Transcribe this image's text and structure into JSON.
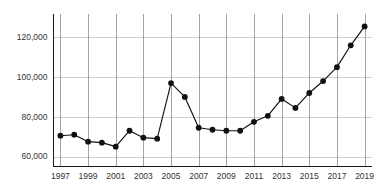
{
  "chart_data": {
    "type": "line",
    "title": "",
    "subtitle": "",
    "xlabel": "",
    "ylabel": "",
    "x": [
      1997,
      1998,
      1999,
      2000,
      2001,
      2002,
      2003,
      2004,
      2005,
      2006,
      2007,
      2008,
      2009,
      2010,
      2011,
      2012,
      2013,
      2014,
      2015,
      2016,
      2017,
      2018,
      2019
    ],
    "values": [
      70500,
      71000,
      67500,
      67000,
      65000,
      73000,
      69500,
      69000,
      97000,
      90000,
      74500,
      73500,
      73000,
      73000,
      77500,
      80500,
      89000,
      84500,
      92000,
      98000,
      105000,
      116000,
      125500
    ],
    "series": [
      {
        "name": "",
        "values": [
          70500,
          71000,
          67500,
          67000,
          65000,
          73000,
          69500,
          69000,
          97000,
          90000,
          74500,
          73500,
          73000,
          73000,
          77500,
          80500,
          89000,
          84500,
          92000,
          98000,
          105000,
          116000,
          125500
        ]
      }
    ],
    "xlim": [
      1996.5,
      2019.5
    ],
    "ylim": [
      55000,
      132000
    ],
    "x_tick_labels": [
      "1997",
      "1999",
      "2001",
      "2003",
      "2005",
      "2007",
      "2009",
      "2011",
      "2013",
      "2015",
      "2017",
      "2019"
    ],
    "x_tick_values": [
      1997,
      1999,
      2001,
      2003,
      2005,
      2007,
      2009,
      2011,
      2013,
      2015,
      2017,
      2019
    ],
    "y_tick_labels": [
      "60,000",
      "80,000",
      "100,000",
      "120,000"
    ],
    "y_tick_values": [
      60000,
      80000,
      100000,
      120000
    ],
    "grid": "both",
    "legend": "none",
    "marker": "filled-circle",
    "line_color": "#111111",
    "marker_color": "#111111",
    "grid_color": "#b9b9b9",
    "vertical_grid_color": "#7f7f7f",
    "axis_color": "#1a1a1a",
    "background_color": "#ffffff",
    "annotations": []
  }
}
